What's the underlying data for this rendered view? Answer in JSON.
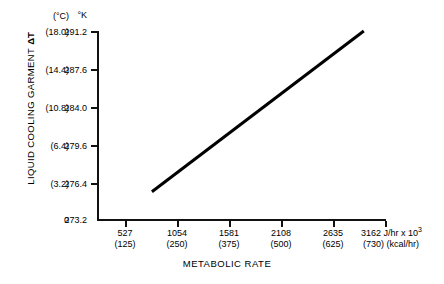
{
  "chart_data": {
    "type": "line",
    "title": "",
    "xlabel": "METABOLIC RATE",
    "ylabel": "LIQUID COOLING GARMENT ΔT",
    "ylabel_main": "LIQUID COOLING GARMENT",
    "ylabel_delta": "ΔT",
    "y_unit_primary": "°K",
    "y_unit_secondary": "(°C)",
    "x_unit_primary": "J/hr x 10³",
    "x_unit_secondary": "(kcal/hr)",
    "grid": false,
    "legend": "none",
    "xlim": [
      0,
      3425
    ],
    "ylim": [
      273.2,
      291.2
    ],
    "x_ticks": [
      {
        "primary": "527",
        "secondary": "(125)"
      },
      {
        "primary": "1054",
        "secondary": "(250)"
      },
      {
        "primary": "1581",
        "secondary": "(375)"
      },
      {
        "primary": "2108",
        "secondary": "(500)"
      },
      {
        "primary": "2635",
        "secondary": "(625)"
      },
      {
        "primary": "3162",
        "secondary": "(730)"
      }
    ],
    "x_last_tick": {
      "value": "3162",
      "unit_primary": "J/hr x 10",
      "unit_exponent": "3",
      "secondary": "(730)",
      "unit_secondary": "(kcal/hr)"
    },
    "y_ticks": [
      {
        "celsius": "(18.0)",
        "kelvin": "291.2"
      },
      {
        "celsius": "(14.4)",
        "kelvin": "287.6"
      },
      {
        "celsius": "(10.8)",
        "kelvin": "284.0"
      },
      {
        "celsius": "(6.4)",
        "kelvin": "279.6"
      },
      {
        "celsius": "(3.2)",
        "kelvin": "276.4"
      },
      {
        "celsius": "0",
        "kelvin": "273.2"
      }
    ],
    "series": [
      {
        "name": "LCG inlet temperature difference",
        "x": [
          651,
          3162
        ],
        "y": [
          275.8,
          291.2
        ],
        "color": "#000000",
        "line_width": 3
      }
    ],
    "annotations": []
  }
}
